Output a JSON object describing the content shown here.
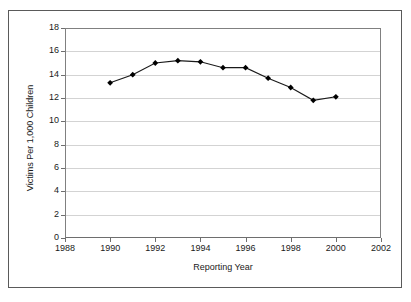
{
  "chart_data": {
    "type": "line",
    "title": "",
    "xlabel": "Reporting Year",
    "ylabel": "Victims Per 1,000 Children",
    "x": [
      1990,
      1991,
      1992,
      1993,
      1994,
      1995,
      1996,
      1997,
      1998,
      1999,
      2000
    ],
    "values": [
      13.3,
      14.0,
      15.0,
      15.2,
      15.1,
      14.6,
      14.6,
      13.7,
      12.9,
      11.8,
      12.1
    ],
    "series": [
      {
        "name": "Victims Per 1,000 Children",
        "values": [
          13.3,
          14.0,
          15.0,
          15.2,
          15.1,
          14.6,
          14.6,
          13.7,
          12.9,
          11.8,
          12.1
        ]
      }
    ],
    "xlim": [
      1988,
      2002
    ],
    "ylim": [
      0,
      18
    ],
    "xticks": [
      1988,
      1990,
      1992,
      1994,
      1996,
      1998,
      2000,
      2002
    ],
    "yticks": [
      0,
      2,
      4,
      6,
      8,
      10,
      12,
      14,
      16,
      18
    ],
    "xtick_labels": [
      "1988",
      "1990",
      "1992",
      "1994",
      "1996",
      "1998",
      "2000",
      "2002"
    ],
    "ytick_labels": [
      "0",
      "2",
      "4",
      "6",
      "8",
      "10",
      "12",
      "14",
      "16",
      "18"
    ],
    "grid": "horizontal",
    "legend": "none",
    "marker": "diamond",
    "line_color": "#1a1a1a",
    "marker_color": "#000000",
    "grid_color": "#d3d3d3",
    "axis_color": "#808080",
    "background_color": "#ffffff"
  }
}
